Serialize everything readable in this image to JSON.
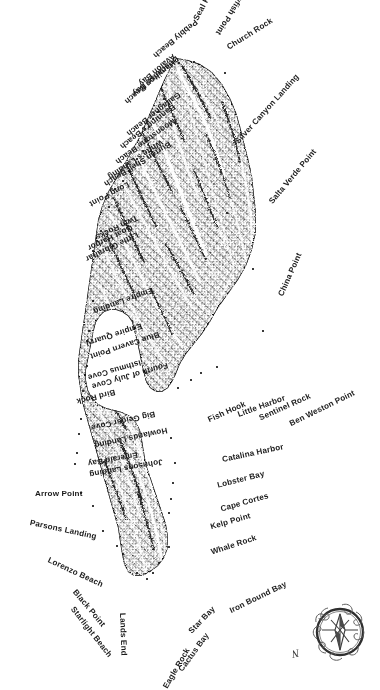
{
  "map": {
    "title": "Santa Catalina Island",
    "background_color": "#ffffff",
    "ink_color": "#1b1b1b",
    "style": "shaded relief / hachure engraving",
    "compass": {
      "name": "compass-rose",
      "north_label": "N"
    }
  },
  "labels": [
    {
      "text": "Jewfish Point",
      "x": 163,
      "y": 30,
      "rot": 58,
      "flip": true,
      "dot_x": 178,
      "dot_y": 62
    },
    {
      "text": "Seal Rocks",
      "x": 196,
      "y": 16,
      "rot": 62,
      "flip": false,
      "dot_x": 193,
      "dot_y": 61
    },
    {
      "text": "Church Rock",
      "x": 228,
      "y": 44,
      "rot": 32,
      "flip": false,
      "dot_x": 224,
      "dot_y": 72
    },
    {
      "text": "Pebbly Beach",
      "x": 99,
      "y": 52,
      "rot": 40,
      "flip": true,
      "dot_x": 163,
      "dot_y": 98
    },
    {
      "text": "Avalon Bay",
      "x": 94,
      "y": 80,
      "rot": 40,
      "flip": true,
      "dot_x": 157,
      "dot_y": 111
    },
    {
      "text": "Descanso Bay",
      "x": 76,
      "y": 90,
      "rot": 40,
      "flip": true,
      "dot_x": 152,
      "dot_y": 118
    },
    {
      "text": "Hamilton Beach",
      "x": 62,
      "y": 98,
      "rot": 40,
      "flip": true,
      "dot_x": 148,
      "dot_y": 126
    },
    {
      "text": "Gallagher Beach",
      "x": 61,
      "y": 130,
      "rot": 38,
      "flip": true,
      "dot_x": 142,
      "dot_y": 150
    },
    {
      "text": "Banning's Beach",
      "x": 53,
      "y": 143,
      "rot": 38,
      "flip": true,
      "dot_x": 136,
      "dot_y": 158
    },
    {
      "text": "Moonstone Beach",
      "x": 44,
      "y": 158,
      "rot": 36,
      "flip": true,
      "dot_x": 128,
      "dot_y": 170
    },
    {
      "text": "White's Landing",
      "x": 44,
      "y": 173,
      "rot": 34,
      "flip": true,
      "dot_x": 122,
      "dot_y": 180
    },
    {
      "text": "Burton Shell Beach",
      "x": 27,
      "y": 180,
      "rot": 32,
      "flip": true,
      "dot_x": 114,
      "dot_y": 188
    },
    {
      "text": "Long Point",
      "x": 46,
      "y": 200,
      "rot": 28,
      "flip": true,
      "dot_x": 108,
      "dot_y": 206
    },
    {
      "text": "Twin Rocks",
      "x": 50,
      "y": 233,
      "rot": 26,
      "flip": true,
      "dot_x": 100,
      "dot_y": 230
    },
    {
      "text": "Goat Harbor",
      "x": 39,
      "y": 244,
      "rot": 26,
      "flip": true,
      "dot_x": 96,
      "dot_y": 240
    },
    {
      "text": "Little Gibraltar",
      "x": 28,
      "y": 255,
      "rot": 26,
      "flip": true,
      "dot_x": 92,
      "dot_y": 250
    },
    {
      "text": "Empire Landing",
      "x": 30,
      "y": 307,
      "rot": 20,
      "flip": true,
      "dot_x": 92,
      "dot_y": 300
    },
    {
      "text": "Empire Quarry",
      "x": 28,
      "y": 339,
      "rot": 18,
      "flip": true,
      "dot_x": 88,
      "dot_y": 330
    },
    {
      "text": "Blue Cavern Point",
      "x": 18,
      "y": 352,
      "rot": 18,
      "flip": true,
      "dot_x": 86,
      "dot_y": 340
    },
    {
      "text": "Isthmus Cove",
      "x": 33,
      "y": 373,
      "rot": 16,
      "flip": true,
      "dot_x": 86,
      "dot_y": 365
    },
    {
      "text": "Fourth of July Cove",
      "x": 13,
      "y": 382,
      "rot": 16,
      "flip": true,
      "dot_x": 84,
      "dot_y": 374
    },
    {
      "text": "Bird Rock",
      "x": 37,
      "y": 397,
      "rot": 14,
      "flip": true,
      "dot_x": 82,
      "dot_y": 390
    },
    {
      "text": "Big Geiger Cove",
      "x": 26,
      "y": 423,
      "rot": 12,
      "flip": true,
      "dot_x": 80,
      "dot_y": 418
    },
    {
      "text": "Howlands Landing",
      "x": 20,
      "y": 441,
      "rot": 12,
      "flip": true,
      "dot_x": 78,
      "dot_y": 433
    },
    {
      "text": "Emerald Bay",
      "x": 37,
      "y": 459,
      "rot": 10,
      "flip": true,
      "dot_x": 76,
      "dot_y": 452
    },
    {
      "text": "Johnsons Landing",
      "x": 15,
      "y": 470,
      "rot": 10,
      "flip": true,
      "dot_x": 74,
      "dot_y": 463
    },
    {
      "text": "Arrow Point",
      "x": 35,
      "y": 490,
      "rot": 0,
      "flip": false,
      "dot_x": 80,
      "dot_y": 492
    },
    {
      "text": "Parsons Landing",
      "x": 30,
      "y": 519,
      "rot": -12,
      "flip": false,
      "dot_x": 92,
      "dot_y": 505
    },
    {
      "text": "Lorenzo Beach",
      "x": 48,
      "y": 556,
      "rot": -25,
      "flip": false,
      "dot_x": 102,
      "dot_y": 530
    },
    {
      "text": "Black Point",
      "x": 74,
      "y": 587,
      "rot": -50,
      "flip": false,
      "dot_x": 116,
      "dot_y": 545
    },
    {
      "text": "Starlight Beach",
      "x": 72,
      "y": 604,
      "rot": -52,
      "flip": false,
      "dot_x": 122,
      "dot_y": 553
    },
    {
      "text": "Lands End",
      "x": 122,
      "y": 609,
      "rot": -88,
      "flip": false,
      "dot_x": 136,
      "dot_y": 572
    },
    {
      "text": "Eagle Rock",
      "x": 143,
      "y": 645,
      "rot": 240,
      "flip": true,
      "dot_x": 146,
      "dot_y": 578
    },
    {
      "text": "Cactus Bay",
      "x": 162,
      "y": 630,
      "rot": 234,
      "flip": true,
      "dot_x": 152,
      "dot_y": 572
    },
    {
      "text": "Star Bay",
      "x": 180,
      "y": 604,
      "rot": 226,
      "flip": true,
      "dot_x": 158,
      "dot_y": 562
    },
    {
      "text": "Iron Bound Bay",
      "x": 224,
      "y": 580,
      "rot": 206,
      "flip": true,
      "dot_x": 168,
      "dot_y": 546
    },
    {
      "text": "Whale Rock",
      "x": 209,
      "y": 534,
      "rot": 198,
      "flip": true,
      "dot_x": 168,
      "dot_y": 512
    },
    {
      "text": "Kelp Point",
      "x": 209,
      "y": 512,
      "rot": 196,
      "flip": true,
      "dot_x": 170,
      "dot_y": 498
    },
    {
      "text": "Cape Cortes",
      "x": 219,
      "y": 492,
      "rot": 196,
      "flip": true,
      "dot_x": 172,
      "dot_y": 482
    },
    {
      "text": "Lobster Bay",
      "x": 216,
      "y": 470,
      "rot": 194,
      "flip": true,
      "dot_x": 174,
      "dot_y": 462
    },
    {
      "text": "Catalina Harbor",
      "x": 221,
      "y": 443,
      "rot": 192,
      "flip": true,
      "dot_x": 170,
      "dot_y": 437
    },
    {
      "text": "Fish Hook",
      "x": 205,
      "y": 400,
      "rot": 204,
      "flip": true,
      "dot_x": 177,
      "dot_y": 387
    },
    {
      "text": "Little Harbor",
      "x": 235,
      "y": 394,
      "rot": 200,
      "flip": true,
      "dot_x": 190,
      "dot_y": 379
    },
    {
      "text": "Sentinel Rock",
      "x": 255,
      "y": 392,
      "rot": 204,
      "flip": true,
      "dot_x": 200,
      "dot_y": 372
    },
    {
      "text": "Ben Weston Point",
      "x": 283,
      "y": 389,
      "rot": 206,
      "flip": true,
      "dot_x": 216,
      "dot_y": 366
    },
    {
      "text": "China Point",
      "x": 281,
      "y": 292,
      "rot": 66,
      "flip": false,
      "dot_x": 262,
      "dot_y": 330
    },
    {
      "text": "Salta Verde Point",
      "x": 271,
      "y": 199,
      "rot": 50,
      "flip": false,
      "dot_x": 252,
      "dot_y": 268
    },
    {
      "text": "Silver Canyon Landing",
      "x": 237,
      "y": 139,
      "rot": 48,
      "flip": false,
      "dot_x": 226,
      "dot_y": 212
    }
  ]
}
